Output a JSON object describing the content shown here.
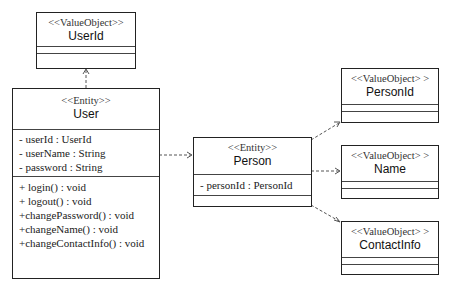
{
  "classes": {
    "userId": {
      "stereotype": "<<ValueObject>>",
      "name": "UserId",
      "attributes": [],
      "operations": []
    },
    "user": {
      "stereotype": "<<Entity>>",
      "name": "User",
      "attributes": [
        "- userId : UserId",
        "- userName : String",
        "- password : String"
      ],
      "operations": [
        "+ login() : void",
        "+ logout() : void",
        "+changePassword() : void",
        "+changeName() : void",
        "+changeContactInfo() : void"
      ]
    },
    "person": {
      "stereotype": "<<Entity>>",
      "name": "Person",
      "attributes": [
        "- personId : PersonId"
      ],
      "operations": []
    },
    "personId": {
      "stereotype": "<<ValueObject> >",
      "name": "PersonId",
      "attributes": [],
      "operations": []
    },
    "nameVO": {
      "stereotype": "<<ValueObject> >",
      "name": "Name",
      "attributes": [],
      "operations": []
    },
    "contactInfo": {
      "stereotype": "<<ValueObject> >",
      "name": "ContactInfo",
      "attributes": [],
      "operations": []
    }
  },
  "relations": [
    {
      "from": "User",
      "to": "UserId",
      "type": "dependency"
    },
    {
      "from": "User",
      "to": "Person",
      "type": "dependency"
    },
    {
      "from": "Person",
      "to": "PersonId",
      "type": "dependency"
    },
    {
      "from": "Person",
      "to": "Name",
      "type": "dependency"
    },
    {
      "from": "Person",
      "to": "ContactInfo",
      "type": "dependency"
    }
  ]
}
